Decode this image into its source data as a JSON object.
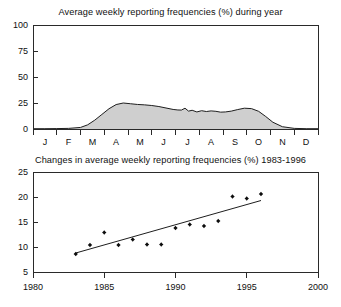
{
  "figure": {
    "name": "reporting-frequency-figure",
    "background": "#ffffff",
    "ink_color": "#1a1a1a"
  },
  "chart_data": [
    {
      "id": "seasonal-profile",
      "type": "area",
      "title": "Average weekly reporting frequencies (%) during year",
      "xlabel": "",
      "ylabel": "",
      "xlim": [
        0,
        12
      ],
      "ylim": [
        0,
        100
      ],
      "yticks": [
        0,
        25,
        50,
        75,
        100
      ],
      "ytick_labels": [
        "0",
        "25",
        "50",
        "75",
        "100"
      ],
      "categories": [
        "J",
        "F",
        "M",
        "A",
        "M",
        "J",
        "J",
        "A",
        "S",
        "O",
        "N",
        "D"
      ],
      "grid": false,
      "legend": "none",
      "fill_color": "#cfcfcf",
      "line_color": "#1e1e1e",
      "x": [
        0.0,
        0.5,
        1.0,
        1.5,
        2.0,
        2.3,
        2.6,
        2.9,
        3.2,
        3.5,
        3.8,
        4.1,
        4.4,
        4.7,
        5.0,
        5.3,
        5.6,
        5.9,
        6.1,
        6.25,
        6.4,
        6.55,
        6.7,
        6.9,
        7.1,
        7.3,
        7.5,
        7.7,
        7.9,
        8.1,
        8.35,
        8.6,
        8.9,
        9.2,
        9.5,
        9.8,
        10.1,
        10.5,
        11.0,
        11.5,
        12.0
      ],
      "values": [
        0.3,
        0.3,
        0.4,
        0.6,
        1.5,
        4.0,
        8.5,
        14.0,
        19.5,
        23.5,
        25.0,
        24.3,
        23.6,
        23.2,
        22.6,
        21.6,
        20.2,
        18.8,
        18.3,
        18.2,
        20.0,
        17.2,
        18.0,
        16.4,
        17.6,
        16.8,
        17.4,
        17.0,
        16.2,
        16.4,
        17.2,
        18.6,
        20.0,
        19.6,
        17.0,
        12.0,
        6.5,
        2.2,
        0.6,
        0.3,
        0.3
      ],
      "units": "%"
    },
    {
      "id": "annual-trend",
      "type": "scatter",
      "title": "Changes in average weekly reporting frequencies (%) 1983-1996",
      "xlabel": "",
      "ylabel": "",
      "xlim": [
        1980,
        2000
      ],
      "ylim": [
        5,
        25
      ],
      "xticks": [
        1980,
        1985,
        1990,
        1995,
        2000
      ],
      "xtick_labels": [
        "1980",
        "1985",
        "1990",
        "1995",
        "2000"
      ],
      "yticks": [
        5,
        10,
        15,
        20,
        25
      ],
      "ytick_labels": [
        "5",
        "10",
        "15",
        "20",
        "25"
      ],
      "grid": false,
      "legend": "none",
      "marker_color": "#0d0d0d",
      "points": [
        {
          "x": 1983,
          "y": 8.6
        },
        {
          "x": 1984,
          "y": 10.4
        },
        {
          "x": 1985,
          "y": 12.9
        },
        {
          "x": 1986,
          "y": 10.4
        },
        {
          "x": 1987,
          "y": 11.5
        },
        {
          "x": 1988,
          "y": 10.5
        },
        {
          "x": 1989,
          "y": 10.5
        },
        {
          "x": 1990,
          "y": 13.8
        },
        {
          "x": 1991,
          "y": 14.5
        },
        {
          "x": 1992,
          "y": 14.2
        },
        {
          "x": 1993,
          "y": 15.2
        },
        {
          "x": 1994,
          "y": 20.1
        },
        {
          "x": 1995,
          "y": 19.7
        },
        {
          "x": 1996,
          "y": 20.6
        }
      ],
      "trend_line": {
        "name": "linear-regression",
        "x_start": 1983,
        "y_start": 8.8,
        "x_end": 1996,
        "y_end": 19.3,
        "color": "#1e1e1e"
      },
      "units": "%"
    }
  ]
}
